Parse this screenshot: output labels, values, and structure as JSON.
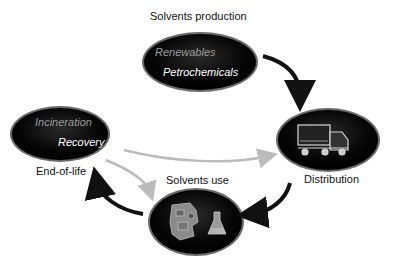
{
  "nodes": {
    "production": {
      "label": "Solvents production",
      "items": [
        "Renewables",
        "Petrochemicals"
      ]
    },
    "distribution": {
      "label": "Distribution",
      "icon": "truck-icon"
    },
    "use": {
      "label": "Solvents use",
      "icons": [
        "engine-icon",
        "flask-icon"
      ]
    },
    "end_of_life": {
      "label": "End-of-life",
      "items": [
        "Incineration",
        "Recovery"
      ]
    }
  },
  "arrows": [
    {
      "from": "production",
      "to": "distribution",
      "style": "black"
    },
    {
      "from": "distribution",
      "to": "use",
      "style": "black"
    },
    {
      "from": "use",
      "to": "end_of_life",
      "style": "black"
    },
    {
      "from": "end_of_life",
      "to": "distribution",
      "style": "grey"
    },
    {
      "from": "end_of_life",
      "to": "use",
      "style": "grey"
    }
  ],
  "colors": {
    "ellipse": "#000000",
    "ellipse_rim": "#555555",
    "arrow_black": "#111111",
    "arrow_grey": "#bdbdbd"
  }
}
